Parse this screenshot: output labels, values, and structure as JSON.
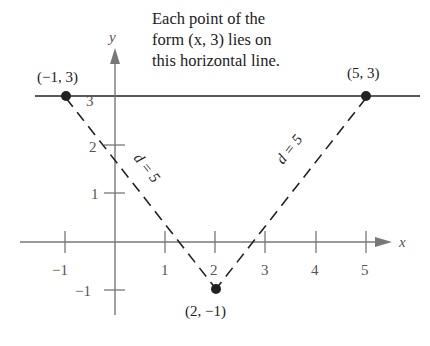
{
  "annotation": {
    "lines": [
      "Each point of the",
      "form (x, 3) lies on",
      "this horizontal line."
    ]
  },
  "axes": {
    "x_label": "x",
    "y_label": "y",
    "x_ticks": [
      "−1",
      "1",
      "2",
      "3",
      "4",
      "5"
    ],
    "y_ticks": [
      "3",
      "2",
      "1",
      "−1"
    ]
  },
  "points": [
    {
      "label": "(−1, 3)",
      "x": -1,
      "y": 3
    },
    {
      "label": "(5, 3)",
      "x": 5,
      "y": 3
    },
    {
      "label": "(2, −1)",
      "x": 2,
      "y": -1
    }
  ],
  "segments": [
    {
      "label": "d = 5",
      "from": "(2, −1)",
      "to": "(−1, 3)"
    },
    {
      "label": "d = 5",
      "from": "(2, −1)",
      "to": "(5, 3)"
    }
  ],
  "horizontal_line": {
    "equation": "y = 3"
  },
  "colors": {
    "axis": "#777777",
    "ink": "#222222"
  }
}
